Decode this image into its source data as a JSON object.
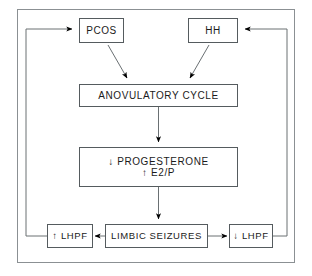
{
  "diagram": {
    "frame": {
      "name": "outer-border"
    },
    "colors": {
      "background": "#ffffff",
      "box_border": "#555b5e",
      "connector": "#6a7073",
      "arrowhead": "#000000",
      "text": "#1b1b1b"
    },
    "nodes": {
      "pcos": {
        "label": "PCOS"
      },
      "hh": {
        "label": "HH"
      },
      "anovulatory_cycle": {
        "label": "ANOVULATORY CYCLE"
      },
      "progesterone": {
        "line1": "↓ PROGESTERONE",
        "line2": "↑ E2/P"
      },
      "lhpf_increase": {
        "label": "↑ LHPF"
      },
      "limbic_seizures": {
        "label": "LIMBIC SEIZURES"
      },
      "lhpf_decrease": {
        "label": "↓ LHPF"
      }
    },
    "edges": [
      {
        "id": "pcos-to-anovulatory",
        "from": "PCOS",
        "to": "ANOVULATORY CYCLE",
        "style": "diagonal-arrow"
      },
      {
        "id": "hh-to-anovulatory",
        "from": "HH",
        "to": "ANOVULATORY CYCLE",
        "style": "diagonal-arrow"
      },
      {
        "id": "anovulatory-to-progesterone",
        "from": "ANOVULATORY CYCLE",
        "to": "↓ PROGESTERONE ↑ E2/P",
        "style": "vertical-arrow"
      },
      {
        "id": "progesterone-to-limbic",
        "from": "↓ PROGESTERONE ↑ E2/P",
        "to": "LIMBIC SEIZURES",
        "style": "vertical-arrow"
      },
      {
        "id": "limbic-to-lhpf-increase",
        "from": "LIMBIC SEIZURES",
        "to": "↑ LHPF",
        "style": "horizontal-arrow-left"
      },
      {
        "id": "limbic-to-lhpf-decrease",
        "from": "LIMBIC SEIZURES",
        "to": "↓ LHPF",
        "style": "horizontal-arrow-right"
      },
      {
        "id": "lhpf-increase-to-pcos",
        "from": "↑ LHPF",
        "to": "PCOS",
        "style": "feedback-loop-left"
      },
      {
        "id": "lhpf-decrease-to-hh",
        "from": "↓ LHPF",
        "to": "HH",
        "style": "feedback-loop-right"
      }
    ]
  }
}
